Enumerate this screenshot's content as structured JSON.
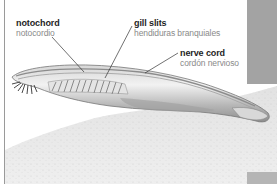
{
  "figure": {
    "colors": {
      "label_primary": "#1e1e1e",
      "label_secondary": "#8a8a8a",
      "leader_line": "#333333",
      "side_panel": "#a3a3a3",
      "left_rule": "#9a9a9a",
      "sand": "#e6e6e6",
      "body": "#b9b9b9"
    },
    "labels": [
      {
        "id": "notochord",
        "en": "notochord",
        "es": "notocordio"
      },
      {
        "id": "gill-slits",
        "en": "gill slits",
        "es": "hendiduras branquiales"
      },
      {
        "id": "nerve-cord",
        "en": "nerve cord",
        "es": "cordón nervioso"
      }
    ]
  }
}
